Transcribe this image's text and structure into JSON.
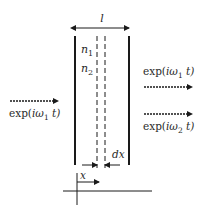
{
  "diagram": {
    "width_label": "l",
    "medium_labels": [
      "n",
      "n"
    ],
    "medium_subscripts": [
      "1",
      "2"
    ],
    "input_wave": {
      "prefix": "exp(",
      "i": "i",
      "omega": "ω",
      "sub": "1",
      "suffix": " t)"
    },
    "output_wave_1": {
      "prefix": "exp(",
      "i": "i",
      "omega": "ω",
      "sub": "1",
      "suffix": " t)"
    },
    "output_wave_2": {
      "prefix": "exp(",
      "i": "i",
      "omega": "ω",
      "sub": "2",
      "suffix": " t)"
    },
    "slice_label": "dx",
    "position_label": "x",
    "colors": {
      "line": "#1a1a1a",
      "text": "#2a2a2a",
      "background": "#ffffff"
    }
  }
}
